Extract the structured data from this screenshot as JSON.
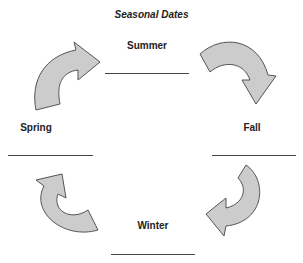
{
  "title": "Seasonal Dates",
  "seasons": {
    "summer": {
      "label": "Summer",
      "answer": ""
    },
    "fall": {
      "label": "Fall",
      "answer": ""
    },
    "winter": {
      "label": "Winter",
      "answer": ""
    },
    "spring": {
      "label": "Spring",
      "answer": ""
    }
  },
  "arrows": {
    "fill": "#cccccc",
    "stroke": "#555555",
    "direction": "clockwise"
  }
}
